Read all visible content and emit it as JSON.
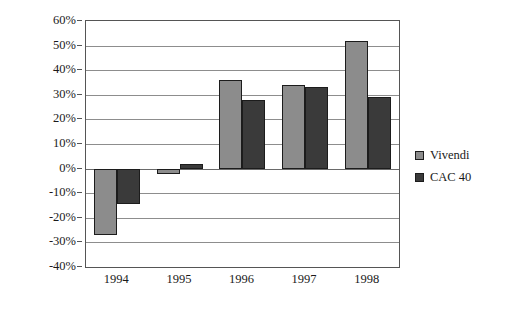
{
  "chart_data": {
    "type": "bar",
    "title": "",
    "subtitle": "",
    "xlabel": "",
    "ylabel": "",
    "categories": [
      "1994",
      "1995",
      "1996",
      "1997",
      "1998"
    ],
    "series": [
      {
        "name": "Vivendi",
        "color": "#8c8c8c",
        "values": [
          -27,
          -2,
          36,
          34,
          52
        ]
      },
      {
        "name": "CAC 40",
        "color": "#3a3a3a",
        "values": [
          -14.5,
          2,
          28,
          33,
          29
        ]
      }
    ],
    "ylim": [
      -40,
      60
    ],
    "ytick_step": 10,
    "ytick_labels": [
      "60%",
      "50%",
      "40%",
      "30%",
      "20%",
      "10%",
      "0%",
      "-10%",
      "-20%",
      "-30%",
      "-40%"
    ],
    "ytick_values": [
      60,
      50,
      40,
      30,
      20,
      10,
      0,
      -10,
      -20,
      -30,
      -40
    ],
    "grid": true,
    "legend_position": "right",
    "plot_border": true
  },
  "legend": {
    "items": [
      {
        "label": "Vivendi"
      },
      {
        "label": "CAC 40"
      }
    ]
  }
}
